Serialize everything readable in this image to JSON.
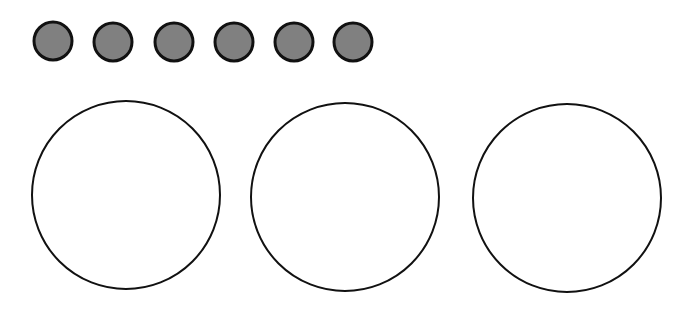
{
  "canvas": {
    "width": 687,
    "height": 318,
    "background": "#ffffff"
  },
  "small_circles": {
    "count": 6,
    "fill": "#808080",
    "stroke": "#111111",
    "stroke_width": 3,
    "radius": 19,
    "items": [
      {
        "cx": 53,
        "cy": 41
      },
      {
        "cx": 113,
        "cy": 42
      },
      {
        "cx": 174,
        "cy": 42
      },
      {
        "cx": 234,
        "cy": 42
      },
      {
        "cx": 294,
        "cy": 42
      },
      {
        "cx": 353,
        "cy": 42
      }
    ]
  },
  "large_circles": {
    "count": 3,
    "fill": "#ffffff",
    "stroke": "#111111",
    "stroke_width": 2,
    "radius": 94,
    "items": [
      {
        "cx": 126,
        "cy": 195
      },
      {
        "cx": 345,
        "cy": 197
      },
      {
        "cx": 567,
        "cy": 198
      }
    ]
  }
}
